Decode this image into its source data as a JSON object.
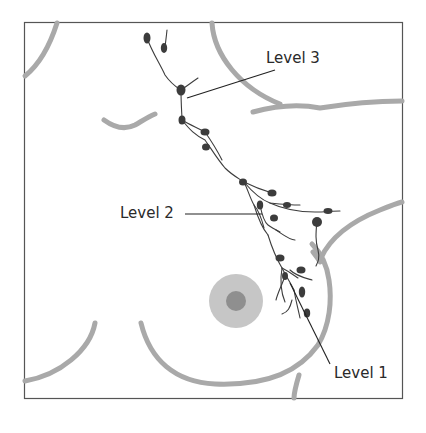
{
  "diagram": {
    "labels": [
      {
        "id": "level-3",
        "text": "Level 3"
      },
      {
        "id": "level-2",
        "text": "Level 2"
      },
      {
        "id": "level-1",
        "text": "Level 1"
      }
    ],
    "colors": {
      "border": "#555555",
      "body_outline": "#a8a8a8",
      "lymph_vessel": "#3a3a3a",
      "lymph_node": "#3c3c3c",
      "leader_line": "#222222",
      "areola": "#c4c4c4",
      "nipple": "#8e8e8e",
      "text": "#2a2a2a"
    }
  }
}
